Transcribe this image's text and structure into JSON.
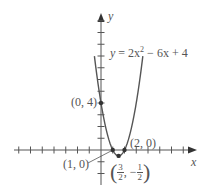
{
  "chart_data": {
    "type": "line",
    "title": "",
    "equation": "y = 2x² − 6x + 4",
    "xlabel": "x",
    "ylabel": "y",
    "xlim": [
      -7,
      7
    ],
    "ylim": [
      -2,
      11
    ],
    "grid": false,
    "series": [
      {
        "name": "y = 2x^2 - 6x + 4",
        "function": "2*x^2 - 6*x + 4",
        "x_range": [
          -0.56,
          3.56
        ],
        "color": "#555555"
      }
    ],
    "points": [
      {
        "x": 0,
        "y": 4,
        "label": "(0, 4)"
      },
      {
        "x": 1,
        "y": 0,
        "label": "(1, 0)"
      },
      {
        "x": 2,
        "y": 0,
        "label": "(2, 0)"
      },
      {
        "x": 1.5,
        "y": -0.5,
        "label": "(3/2, −1/2)"
      }
    ],
    "x_ticks": [
      -7,
      -6,
      -5,
      -4,
      -3,
      -2,
      -1,
      1,
      2,
      3,
      4,
      5,
      6,
      7
    ],
    "y_ticks": [
      -2,
      -1,
      1,
      2,
      3,
      4,
      5,
      6,
      7,
      8,
      9,
      10,
      11
    ]
  },
  "labels": {
    "equation_lhs": "y",
    "equation_rhs": " = 2x",
    "equation_exp": "2",
    "equation_tail": " − 6x + 4",
    "y_axis": "y",
    "x_axis": "x",
    "pt_0_4": "(0, 4)",
    "pt_1_0": "(1, 0)",
    "pt_2_0": "(2, 0)",
    "vertex_open": "(",
    "vertex_x_num": "3",
    "vertex_x_den": "2",
    "vertex_sep": ", −",
    "vertex_y_num": "1",
    "vertex_y_den": "2",
    "vertex_close": ")"
  }
}
